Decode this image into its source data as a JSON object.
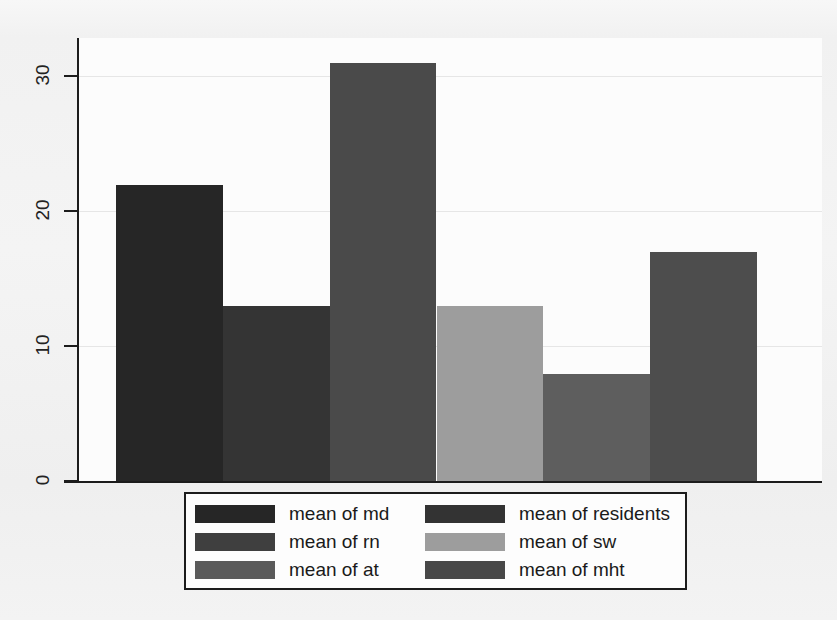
{
  "chart_data": {
    "type": "bar",
    "title": "",
    "subtitle": "",
    "xlabel": "",
    "ylabel": "",
    "categories": [
      "md",
      "rn",
      "at",
      "sw",
      "residents",
      "mht"
    ],
    "series": [
      {
        "name": "means",
        "values": [
          22,
          13,
          31,
          13,
          8,
          17
        ]
      }
    ],
    "bars": [
      {
        "category": "md",
        "label": "mean of md",
        "value": 22,
        "color": "#262626"
      },
      {
        "category": "rn",
        "label": "mean of rn",
        "value": 13,
        "color": "#343434"
      },
      {
        "category": "at",
        "label": "mean of at",
        "value": 31,
        "color": "#4a4a4a"
      },
      {
        "category": "sw",
        "label": "mean of sw",
        "value": 13,
        "color": "#9d9d9d"
      },
      {
        "category": "residents",
        "label": "mean of residents",
        "value": 8,
        "color": "#5e5e5e"
      },
      {
        "category": "mht",
        "label": "mean of mht",
        "value": 17,
        "color": "#4d4d4d"
      }
    ],
    "ylim": [
      0,
      32.8
    ],
    "yticks": [
      0,
      10,
      20,
      30
    ],
    "ytick_labels": [
      "0",
      "10",
      "20",
      "30"
    ],
    "xticks": [],
    "xtick_labels": [],
    "grid": true,
    "grid_axis": "y",
    "legend_position": "bottom-center",
    "legend_columns": 2
  },
  "axis": {
    "y_tick_labels": [
      "30",
      "20",
      "10",
      "0"
    ]
  },
  "legend": {
    "entries": [
      {
        "label": "mean of md",
        "color": "#262626"
      },
      {
        "label": "mean of residents",
        "color": "#333333"
      },
      {
        "label": "mean of rn",
        "color": "#3f3f3f"
      },
      {
        "label": "mean of sw",
        "color": "#9d9d9d"
      },
      {
        "label": "mean of at",
        "color": "#5a5a5a"
      },
      {
        "label": "mean of mht",
        "color": "#484848"
      }
    ]
  },
  "colors": {
    "axis": "#1c1c1c",
    "grid": "#e6e6e6",
    "plot_background": "#fcfcfc",
    "page_background": "#f2f2f2"
  }
}
